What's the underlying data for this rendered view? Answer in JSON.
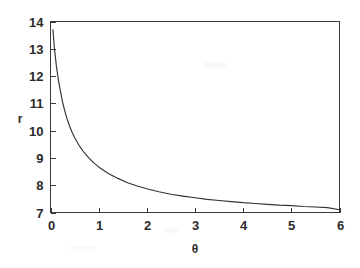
{
  "chart_data": {
    "type": "line",
    "title": "",
    "subtitle": "",
    "xlabel": "θ",
    "ylabel": "r",
    "xlim": [
      0,
      6
    ],
    "ylim": [
      7,
      14
    ],
    "x_ticks": [
      "0",
      "1",
      "2",
      "3",
      "4",
      "5",
      "6"
    ],
    "x_tick_values": [
      0,
      1,
      2,
      3,
      4,
      5,
      6
    ],
    "y_ticks": [
      "7",
      "8",
      "9",
      "10",
      "11",
      "12",
      "13",
      "14"
    ],
    "y_tick_values": [
      7,
      8,
      9,
      10,
      11,
      12,
      13,
      14
    ],
    "grid": false,
    "legend": null,
    "legend_position": "none",
    "line_color": "#333333",
    "axis_color": "#3a3a3a",
    "background_color": "#ffffff",
    "series": [
      {
        "name": "r(θ)",
        "x": [
          0.05,
          0.08,
          0.12,
          0.16,
          0.2,
          0.25,
          0.3,
          0.35,
          0.4,
          0.45,
          0.5,
          0.6,
          0.7,
          0.8,
          0.9,
          1.0,
          1.2,
          1.4,
          1.6,
          1.8,
          2.0,
          2.25,
          2.5,
          2.75,
          3.0,
          3.25,
          3.5,
          3.75,
          4.0,
          4.25,
          4.5,
          4.75,
          5.0,
          5.25,
          5.5,
          5.75,
          6.0
        ],
        "y": [
          13.7,
          13.05,
          12.4,
          11.9,
          11.5,
          11.05,
          10.7,
          10.4,
          10.15,
          9.93,
          9.75,
          9.44,
          9.19,
          8.99,
          8.82,
          8.67,
          8.43,
          8.25,
          8.09,
          7.97,
          7.87,
          7.76,
          7.67,
          7.6,
          7.54,
          7.48,
          7.44,
          7.4,
          7.36,
          7.33,
          7.3,
          7.27,
          7.25,
          7.22,
          7.2,
          7.18,
          7.1
        ]
      }
    ],
    "curve_start": {
      "theta": 0.05,
      "r": 13.7
    },
    "curve_end": {
      "theta": 6.0,
      "r": 7.1
    },
    "asymptote": 7
  },
  "axes": {
    "x_axis_label": "θ",
    "y_axis_label": "r"
  }
}
